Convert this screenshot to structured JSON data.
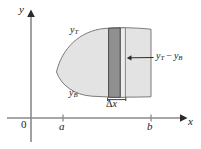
{
  "figure": {
    "background_color": "#ffffff",
    "width": 201,
    "height": 149
  },
  "axes": {
    "x_axis_label": "x",
    "y_axis_label": "y",
    "origin_label": "0",
    "x_axis_y_px": 118,
    "y_axis_x_px": 31,
    "ticks": [
      {
        "name": "a",
        "label": "a",
        "x_px": 63
      },
      {
        "name": "b",
        "label": "b",
        "x_px": 151
      }
    ],
    "axis_color": "#8a8a8a",
    "tick_color": "#8a8a8a"
  },
  "region": {
    "fill_color": "#e2e2e2",
    "stroke_color": "#6e6e6e",
    "top_curve_label": "y",
    "top_curve_subscript": "T",
    "bottom_curve_label": "y",
    "bottom_curve_subscript": "B"
  },
  "strip": {
    "fill_color": "#8f8f8f",
    "stroke_color": "#4a4a4a",
    "width_label_symbol": "Δ",
    "width_label_variable": "x",
    "left_px": 108,
    "right_px": 120
  },
  "secondary_strip": {
    "fill_color": "#ececec",
    "stroke_color": "#6e6e6e",
    "left_px": 120,
    "right_px": 125
  },
  "callout": {
    "text_minuend": "y",
    "text_minuend_sub": "T",
    "operator": "−",
    "text_subtrahend": "y",
    "text_subtrahend_sub": "B",
    "leader_color": "#2a2a2a",
    "target_x_px": 128,
    "target_y_px": 58
  }
}
